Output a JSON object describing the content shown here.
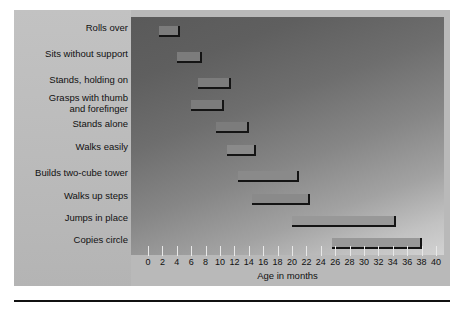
{
  "chart_data": {
    "type": "bar",
    "orientation": "horizontal-range",
    "title": "",
    "subtitle": "",
    "xlabel": "Age in months",
    "ylabel": "",
    "xlim": [
      0,
      40
    ],
    "xtick_step": 2,
    "grid": false,
    "legend": "none",
    "xticks": [
      "0",
      "2",
      "4",
      "6",
      "8",
      "10",
      "12",
      "14",
      "16",
      "18",
      "20",
      "22",
      "24",
      "26",
      "28",
      "30",
      "32",
      "34",
      "36",
      "38",
      "40"
    ],
    "categories": [
      "Rolls over",
      "Sits without support",
      "Stands, holding on",
      "Grasps with thumb\nand forefinger",
      "Stands alone",
      "Walks easily",
      "Builds two-cube tower",
      "Walks up steps",
      "Jumps in place",
      "Copies circle"
    ],
    "bars": [
      {
        "label": "Rolls over",
        "start": 1.5,
        "end": 4.5,
        "shade": "dark"
      },
      {
        "label": "Sits without support",
        "start": 4.0,
        "end": 7.5,
        "shade": "dark"
      },
      {
        "label": "Grasps with thumb and forefinger",
        "start": 6.0,
        "end": 10.5,
        "shade": "dark"
      },
      {
        "label": "Stands, holding on",
        "start": 7.0,
        "end": 11.5,
        "shade": "dark"
      },
      {
        "label": "Stands alone",
        "start": 9.5,
        "end": 14.0,
        "shade": "dark"
      },
      {
        "label": "Walks easily",
        "start": 11.0,
        "end": 15.0,
        "shade": "mid"
      },
      {
        "label": "Builds two-cube tower",
        "start": 12.5,
        "end": 21.0,
        "shade": "mid"
      },
      {
        "label": "Walks up steps",
        "start": 14.5,
        "end": 22.5,
        "shade": "mid"
      },
      {
        "label": "Jumps in place",
        "start": 20.0,
        "end": 34.5,
        "shade": "light"
      },
      {
        "label": "Copies circle",
        "start": 25.5,
        "end": 38.0,
        "shade": "light"
      }
    ],
    "series": [
      {
        "name": "start_month",
        "values": [
          1.5,
          4.0,
          7.0,
          6.0,
          9.5,
          11.0,
          12.5,
          14.5,
          20.0,
          25.5
        ]
      },
      {
        "name": "end_month",
        "values": [
          4.5,
          7.5,
          11.5,
          10.5,
          14.0,
          15.0,
          21.0,
          22.5,
          34.5,
          38.0
        ]
      }
    ]
  },
  "rows": [
    {
      "label": "Rolls over"
    },
    {
      "label": "Sits without support"
    },
    {
      "label": "Stands, holding on"
    },
    {
      "label": "Grasps with thumb\nand forefinger"
    },
    {
      "label": "Stands alone"
    },
    {
      "label": "Walks easily"
    },
    {
      "label": "Builds two-cube tower"
    },
    {
      "label": "Walks up steps"
    },
    {
      "label": "Jumps in place"
    },
    {
      "label": "Copies circle"
    }
  ],
  "axis": {
    "title": "Age in months",
    "min": 0,
    "max": 40,
    "step": 2
  },
  "colors": {
    "panel_background": "#b9b9b9",
    "plot_dark": "#5a5a5a",
    "plot_light": "#d2d2d2",
    "bar_fill": "#8d8d8d",
    "bar_shadow": "#141414",
    "text": "#111111",
    "tick": "#e8e8e8",
    "rule": "#111111"
  }
}
